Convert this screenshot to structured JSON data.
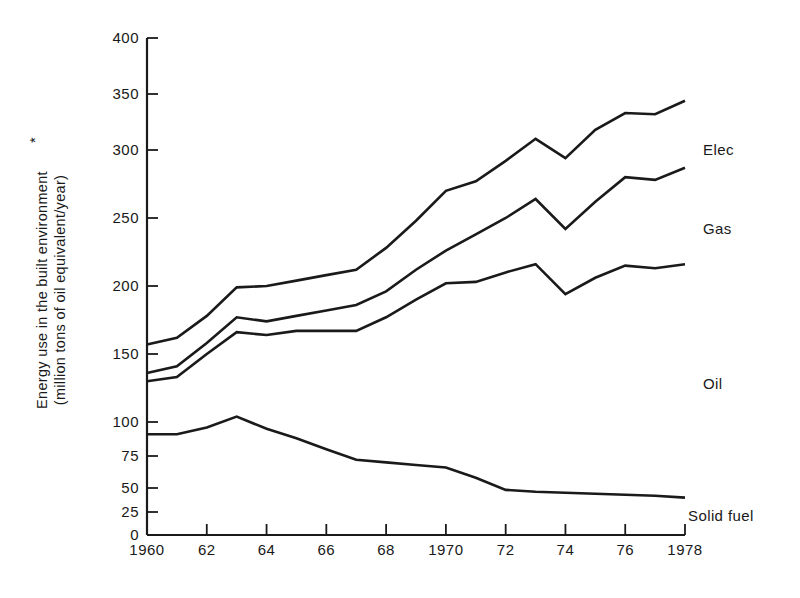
{
  "chart_data": {
    "type": "line",
    "title": "",
    "xlabel": "",
    "ylabel": "Energy use in the built environment*\n(million tons of oil equivalent/year)",
    "ylabel_line1": "Energy use in the built environment",
    "ylabel_superscript": "*",
    "ylabel_line2": "(million tons of oil equivalent/year)",
    "grid": false,
    "legend_position": "right-inline",
    "x": [
      1960,
      1961,
      1962,
      1963,
      1964,
      1965,
      1966,
      1967,
      1968,
      1969,
      1970,
      1971,
      1972,
      1973,
      1974,
      1975,
      1976,
      1977,
      1978
    ],
    "xtick_values": [
      1960,
      1962,
      1964,
      1966,
      1968,
      1970,
      1972,
      1974,
      1976,
      1978
    ],
    "xtick_labels": [
      "1960",
      "62",
      "64",
      "66",
      "68",
      "1970",
      "72",
      "74",
      "76",
      "1978"
    ],
    "ytick_values": [
      0,
      25,
      50,
      75,
      100,
      150,
      200,
      250,
      300,
      350,
      400
    ],
    "ytick_labels": [
      "0",
      "25",
      "50",
      "75",
      "100",
      "150",
      "200",
      "250",
      "300",
      "350",
      "400"
    ],
    "ylim": [
      0,
      400
    ],
    "xlim": [
      1960,
      1978
    ],
    "y_axis_note": "non-linear spacing below 100 (25-unit ticks) and 50-unit ticks above 100",
    "series": [
      {
        "name": "Elec",
        "label": "Elec",
        "color": "#1a1a1a",
        "values": [
          157,
          162,
          178,
          199,
          200,
          204,
          208,
          212,
          228,
          248,
          270,
          277,
          292,
          310,
          294,
          318,
          333,
          332,
          344
        ]
      },
      {
        "name": "Gas",
        "label": "Gas",
        "color": "#1a1a1a",
        "values": [
          136,
          141,
          158,
          177,
          174,
          178,
          182,
          186,
          196,
          212,
          226,
          238,
          250,
          264,
          242,
          262,
          280,
          278,
          287
        ]
      },
      {
        "name": "Oil",
        "label": "Oil",
        "color": "#1a1a1a",
        "values": [
          130,
          133,
          150,
          166,
          164,
          167,
          167,
          167,
          177,
          190,
          202,
          203,
          210,
          216,
          194,
          206,
          215,
          213,
          216
        ]
      },
      {
        "name": "Solid fuel",
        "label": "Solid fuel",
        "color": "#1a1a1a",
        "values": [
          91,
          91,
          96,
          104,
          95,
          88,
          80,
          72,
          70,
          68,
          66,
          58,
          48,
          46,
          45,
          44,
          43,
          42,
          40
        ]
      }
    ]
  },
  "labels": {
    "elec": "Elec",
    "gas": "Gas",
    "oil": "Oil",
    "solid_fuel": "Solid fuel"
  },
  "axis": {
    "y_title_line1": "Energy use in the built environment",
    "y_title_star": "*",
    "y_title_line2": "(million tons of oil equivalent/year)"
  },
  "ticks": {
    "y": [
      "400",
      "350",
      "300",
      "250",
      "200",
      "150",
      "100",
      "75",
      "50",
      "25",
      "0"
    ],
    "x": [
      "1960",
      "62",
      "64",
      "66",
      "68",
      "1970",
      "72",
      "74",
      "76",
      "1978"
    ]
  }
}
